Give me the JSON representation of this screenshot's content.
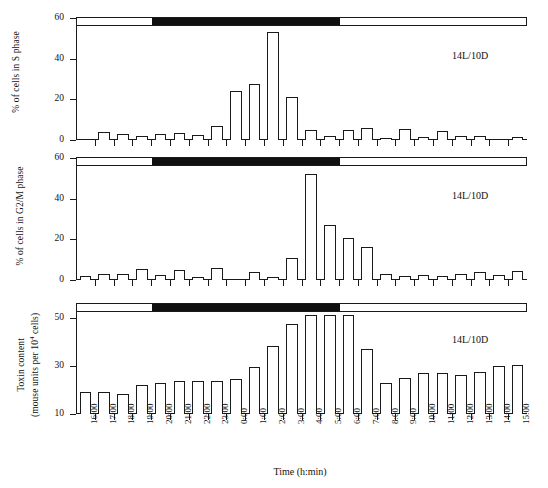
{
  "figure": {
    "xaxis_title": "Time (h:min)",
    "xtick_labels": [
      "16:00",
      "17:00",
      "18:00",
      "19:00",
      "20:00",
      "21:00",
      "22:00",
      "23:00",
      "0:00",
      "1:00",
      "2:00",
      "3:00",
      "4:00",
      "5:00",
      "6:00",
      "7:00",
      "8:00",
      "9:00",
      "10:00",
      "11:00",
      "12:00",
      "13:00",
      "14:00",
      "15:00"
    ],
    "photoperiod_annotation": "14L/10D",
    "light_start": "6:00",
    "dark_start": "20:00",
    "colors": {
      "ink": "#1a1a1a",
      "dark_phase": "#101010",
      "background": "#ffffff"
    }
  },
  "chart_data": [
    {
      "type": "bar",
      "panel": "A",
      "title": "",
      "xlabel": "Time (h:min)",
      "ylabel": "% of cells in S phase",
      "ylim": [
        0,
        60
      ],
      "yticks": [
        0,
        20,
        40,
        60
      ],
      "grid": false,
      "annotation": "14L/10D",
      "categories": [
        "16:00",
        "17:00",
        "18:00",
        "19:00",
        "20:00",
        "21:00",
        "22:00",
        "23:00",
        "0:00",
        "1:00",
        "2:00",
        "3:00",
        "4:00",
        "5:00",
        "6:00",
        "7:00",
        "8:00",
        "9:00",
        "10:00",
        "11:00",
        "12:00",
        "13:00",
        "14:00",
        "15:00"
      ],
      "values": [
        0,
        4,
        3,
        2,
        3,
        3.5,
        2.5,
        7,
        24,
        27.5,
        53,
        21,
        5,
        2,
        5,
        6,
        1.2,
        5.5,
        1.5,
        4.5,
        2,
        2,
        0,
        1.5
      ]
    },
    {
      "type": "bar",
      "panel": "B",
      "title": "",
      "xlabel": "Time (h:min)",
      "ylabel": "% of cells in G2/M phase",
      "ylim": [
        0,
        60
      ],
      "yticks": [
        0,
        20,
        40,
        60
      ],
      "grid": false,
      "annotation": "14L/10D",
      "categories": [
        "16:00",
        "17:00",
        "18:00",
        "19:00",
        "20:00",
        "21:00",
        "22:00",
        "23:00",
        "0:00",
        "1:00",
        "2:00",
        "3:00",
        "4:00",
        "5:00",
        "6:00",
        "7:00",
        "8:00",
        "9:00",
        "10:00",
        "11:00",
        "12:00",
        "13:00",
        "14:00",
        "15:00"
      ],
      "values": [
        2,
        3,
        3,
        5.5,
        2.5,
        5,
        1.5,
        6,
        0,
        4,
        1.5,
        11,
        52,
        27,
        20.5,
        16,
        3,
        2,
        2.5,
        2,
        3,
        4,
        2.5,
        4.5
      ]
    },
    {
      "type": "bar",
      "panel": "C",
      "title": "",
      "xlabel": "Time (h:min)",
      "ylabel": "Toxin content (mouse units per 10⁴ cells)",
      "ylim": [
        10,
        56
      ],
      "yticks": [
        10,
        30,
        50
      ],
      "grid": false,
      "annotation": "14L/10D",
      "categories": [
        "16:00",
        "17:00",
        "18:00",
        "19:00",
        "20:00",
        "21:00",
        "22:00",
        "23:00",
        "0:00",
        "1:00",
        "2:00",
        "3:00",
        "4:00",
        "5:00",
        "6:00",
        "7:00",
        "8:00",
        "9:00",
        "10:00",
        "11:00",
        "12:00",
        "13:00",
        "14:00",
        "15:00"
      ],
      "values": [
        19,
        19,
        18.5,
        22,
        23,
        24,
        24,
        24,
        24.5,
        29.5,
        38.5,
        47.5,
        51.5,
        51.5,
        51.5,
        37,
        23,
        25,
        27,
        27,
        26.5,
        27.5,
        30,
        30.5
      ]
    }
  ],
  "panels": {
    "a": {
      "ylabel_line1": "% of cells in S phase",
      "annotation": "14L/10D"
    },
    "b": {
      "ylabel_line1": "% of cells in G2/M phase",
      "annotation": "14L/10D"
    },
    "c": {
      "ylabel_line1": "Toxin content",
      "ylabel_line2_pre": "(mouse units per 10",
      "ylabel_line2_sup": "4",
      "ylabel_line2_post": " cells)",
      "annotation": "14L/10D"
    }
  }
}
